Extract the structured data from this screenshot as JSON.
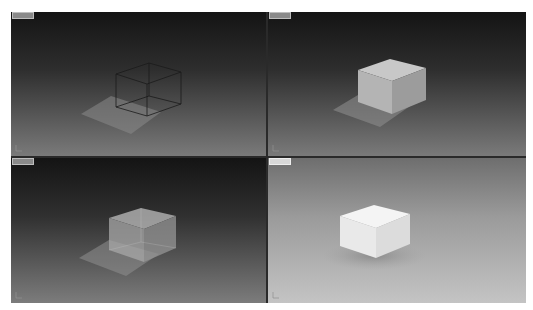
{
  "app": {
    "layout": "four-viewport 3D scene view"
  },
  "viewports": [
    {
      "position": "top-left",
      "label": "",
      "shading": "wireframe",
      "object": "box"
    },
    {
      "position": "top-right",
      "label": "",
      "shading": "shaded",
      "object": "box"
    },
    {
      "position": "bottom-left",
      "label": "",
      "shading": "x-ray / transparent",
      "object": "box"
    },
    {
      "position": "bottom-right",
      "label": "",
      "shading": "rendered",
      "object": "box"
    }
  ],
  "colors": {
    "viewport_bg_top": "#141414",
    "viewport_bg_bottom": "#7a7a7a",
    "rendered_bg_top": "#6e6e6e",
    "rendered_bg_bottom": "#c4c4c4",
    "divider": "#2a2a2a",
    "wire": "#1a1a1a",
    "shadow": "#9a9a9a"
  }
}
